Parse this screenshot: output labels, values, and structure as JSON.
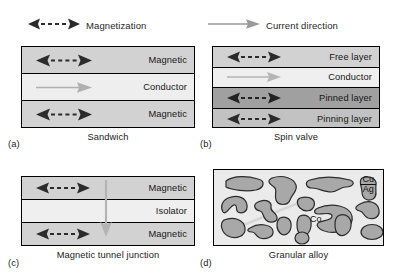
{
  "figure": {
    "legend": [
      {
        "id": "magnetization",
        "label": "Magnetization",
        "arrow": "double-headed-dashed-arrow",
        "color": "#2b2b2b"
      },
      {
        "id": "current-direction",
        "label": "Current direction",
        "arrow": "right-arrow",
        "color": "#9a9a9a"
      }
    ],
    "panels": [
      {
        "tag": "(a)",
        "caption": "Sandwich",
        "layers": [
          {
            "label": "Magnetic",
            "fill": "#d2d2d2",
            "arrow": "magnetization"
          },
          {
            "label": "Conductor",
            "fill": "#eeeeee",
            "arrow": "current"
          },
          {
            "label": "Magnetic",
            "fill": "#d2d2d2",
            "arrow": "magnetization"
          }
        ]
      },
      {
        "tag": "(b)",
        "caption": "Spin valve",
        "layers": [
          {
            "label": "Free layer",
            "fill": "#d2d2d2",
            "arrow": "magnetization"
          },
          {
            "label": "Conductor",
            "fill": "#efefef",
            "arrow": "current"
          },
          {
            "label": "Pinned layer",
            "fill": "#a0a0a0",
            "arrow": "magnetization"
          },
          {
            "label": "Pinning layer",
            "fill": "#c2c2c2",
            "arrow": "magnetization"
          }
        ]
      },
      {
        "tag": "(c)",
        "caption": "Magnetic tunnel junction",
        "layers": [
          {
            "label": "Magnetic",
            "fill": "#d2d2d2",
            "arrow": "magnetization"
          },
          {
            "label": "Isolator",
            "fill": "#efefef",
            "arrow": "none"
          },
          {
            "label": "Magnetic",
            "fill": "#d2d2d2",
            "arrow": "magnetization"
          }
        ],
        "vertical_arrow": {
          "name": "current-direction-vertical-arrow",
          "color": "#b4b4b4",
          "direction": "down"
        }
      },
      {
        "tag": "(d)",
        "caption": "Granular alloy",
        "matrix_label": {
          "numerator": "Cu",
          "denominator": "Ag"
        },
        "grain_label": "Co",
        "matrix_fill": "#ebebeb",
        "grain_fill": "#a8a8a8",
        "grain_stroke": "#2b2b2b"
      }
    ]
  }
}
